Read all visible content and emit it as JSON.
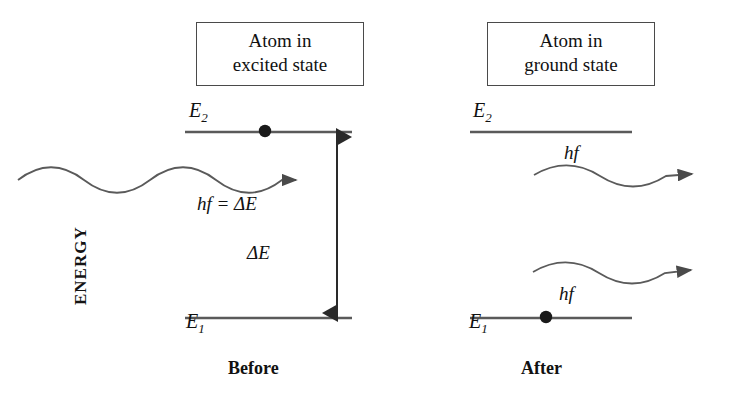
{
  "figure": {
    "width": 740,
    "height": 406,
    "background_color": "#ffffff",
    "line_color": "#555555",
    "text_color": "#111111",
    "arrow_gray": "#8a8a8a"
  },
  "left_panel": {
    "title_box": "Atom in\nexcited state",
    "upper_level_label": "E",
    "upper_level_sub": "2",
    "lower_level_label": "E",
    "lower_level_sub": "1",
    "photon_equation": "hf = ΔE",
    "transition_label": "ΔE",
    "caption": "Before",
    "energy_arrow_label": "ENERGY",
    "electron_on_level": "upper"
  },
  "right_panel": {
    "title_box": "Atom in\nground state",
    "upper_level_label": "E",
    "upper_level_sub": "2",
    "lower_level_label": "E",
    "lower_level_sub": "1",
    "photon_label_top": "hf",
    "photon_label_bottom": "hf",
    "caption": "After",
    "electron_on_level": "lower"
  }
}
